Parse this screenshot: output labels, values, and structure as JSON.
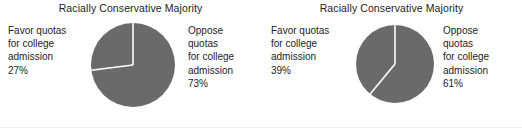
{
  "figure": {
    "background_color": "#ffffff",
    "slice_color": "#6a6a6a",
    "separator_color": "#ffffff",
    "text_color": "#1c1c1c"
  },
  "panels": [
    {
      "id": "panel-a",
      "title": "Racially Conservative Majority",
      "favor": {
        "line1": "Favor quotas",
        "line2": "for college",
        "line3": "admission",
        "value": "27%"
      },
      "oppose": {
        "line1": "Oppose",
        "line2": "quotas",
        "line3": "for college",
        "line4": "admission",
        "value": "73%"
      }
    },
    {
      "id": "panel-b",
      "title": "Racially Conservative Majority",
      "favor": {
        "line1": "Favor quotas",
        "line2": "for college",
        "line3": "admission",
        "value": "39%"
      },
      "oppose": {
        "line1": "Oppose",
        "line2": "quotas",
        "line3": "for college",
        "line4": "admission",
        "value": "61%"
      }
    }
  ],
  "chart_data": [
    {
      "type": "pie",
      "title": "Racially Conservative Majority",
      "labels": [
        "Favor quotas for college admission",
        "Oppose quotas for college admission"
      ],
      "values": [
        27,
        73
      ],
      "value_labels": [
        "27%",
        "73%"
      ],
      "units": "percent",
      "colors": [
        "#6a6a6a",
        "#6a6a6a"
      ],
      "separator_color": "#ffffff",
      "start_angle_deg": 90,
      "direction": "counterclockwise",
      "legend": "outside-left-and-right",
      "grid": false
    },
    {
      "type": "pie",
      "title": "Racially Conservative Majority",
      "labels": [
        "Favor quotas for college admission",
        "Oppose quotas for college admission"
      ],
      "values": [
        39,
        61
      ],
      "value_labels": [
        "39%",
        "61%"
      ],
      "units": "percent",
      "colors": [
        "#6a6a6a",
        "#6a6a6a"
      ],
      "separator_color": "#ffffff",
      "start_angle_deg": 90,
      "direction": "counterclockwise",
      "legend": "outside-left-and-right",
      "grid": false
    }
  ]
}
